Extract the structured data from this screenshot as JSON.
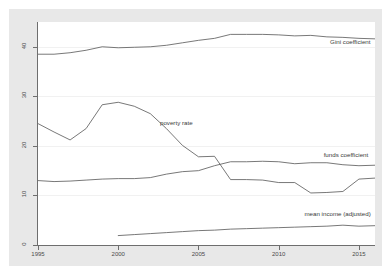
{
  "chart_data": {
    "type": "line",
    "title": "",
    "subtitle": "",
    "xlabel": "",
    "ylabel": "",
    "xlim": [
      1995,
      2016
    ],
    "ylim": [
      0,
      45
    ],
    "grid": true,
    "legend_position": "inline-annotations",
    "x": [
      1995,
      1996,
      1997,
      1998,
      1999,
      2000,
      2001,
      2002,
      2003,
      2004,
      2005,
      2006,
      2007,
      2008,
      2009,
      2010,
      2011,
      2012,
      2013,
      2014,
      2015,
      2016
    ],
    "xticks": [
      1995,
      2000,
      2005,
      2010,
      2015
    ],
    "xtick_labels": [
      "1995",
      "2000",
      "2005",
      "2010",
      "2015"
    ],
    "yticks": [
      0,
      10,
      20,
      30,
      40
    ],
    "ytick_labels": [
      "0",
      "10",
      "20",
      "30",
      "40"
    ],
    "series": [
      {
        "name": "Gini coefficient",
        "label": "Gini coefficient",
        "color": "#555555",
        "values": [
          38.5,
          38.5,
          38.8,
          39.3,
          40.0,
          39.8,
          39.9,
          40.0,
          40.3,
          40.8,
          41.3,
          41.7,
          42.5,
          42.5,
          42.5,
          42.4,
          42.2,
          42.3,
          42.0,
          41.9,
          41.7,
          41.6
        ]
      },
      {
        "name": "poverty rate",
        "label": "poverty rate",
        "color": "#555555",
        "values": [
          24.5,
          22.8,
          21.2,
          23.5,
          28.3,
          28.8,
          28.0,
          26.5,
          23.5,
          20.1,
          17.8,
          17.9,
          13.2,
          13.2,
          13.1,
          12.6,
          12.6,
          10.5,
          10.6,
          10.8,
          13.3,
          13.5
        ]
      },
      {
        "name": "funds coefficient",
        "label": "funds coefficient",
        "color": "#555555",
        "values": [
          13.0,
          12.8,
          12.9,
          13.1,
          13.3,
          13.4,
          13.4,
          13.6,
          14.3,
          14.8,
          15.0,
          16.0,
          16.8,
          16.8,
          16.9,
          16.8,
          16.4,
          16.6,
          16.6,
          16.2,
          16.0,
          16.1
        ]
      },
      {
        "name": "mean income (adjusted)",
        "label": "mean income (adjusted)",
        "color": "#555555",
        "start_year": 2000,
        "values": [
          null,
          null,
          null,
          null,
          null,
          1.9,
          2.1,
          2.3,
          2.5,
          2.7,
          2.9,
          3.0,
          3.2,
          3.3,
          3.4,
          3.5,
          3.6,
          3.7,
          3.8,
          4.0,
          3.8,
          3.9
        ]
      }
    ],
    "annotations": [
      {
        "text": "Gini coefficient",
        "x": 2013.2,
        "y": 41.0
      },
      {
        "text": "poverty rate",
        "x": 2002.6,
        "y": 24.6
      },
      {
        "text": "funds coefficient",
        "x": 2012.8,
        "y": 18.2
      },
      {
        "text": "mean income (adjusted)",
        "x": 2011.6,
        "y": 6.2
      }
    ]
  },
  "axes": {
    "y_labels": [
      "0",
      "10",
      "20",
      "30",
      "40"
    ],
    "x_labels": [
      "1995",
      "2000",
      "2005",
      "2010",
      "2015"
    ]
  },
  "colors": {
    "line": "#555555",
    "axis": "#6e6e6e",
    "grid": "#f1f1f1",
    "panel_background": "#ffffff",
    "graph_background": "#e8e8e8",
    "page_background": "#ffffff",
    "text": "#3a3a3a"
  }
}
